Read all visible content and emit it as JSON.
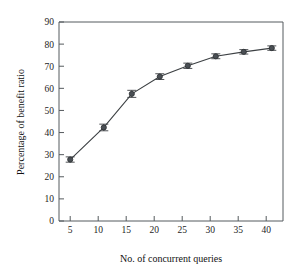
{
  "chart_data": {
    "type": "line",
    "title": "",
    "xlabel": "No. of concurrent queries",
    "ylabel": "Percentage of benefit ratio",
    "xlim": [
      3,
      43
    ],
    "ylim": [
      0,
      90
    ],
    "grid": false,
    "legend": null,
    "xticks": [
      5,
      10,
      15,
      20,
      25,
      30,
      35,
      40
    ],
    "yticks": [
      0,
      10,
      20,
      30,
      40,
      50,
      60,
      70,
      80,
      90
    ],
    "xticklabels": [
      "5",
      "10",
      "15",
      "20",
      "25",
      "30",
      "35",
      "40"
    ],
    "yticklabels": [
      "0",
      "10",
      "20",
      "30",
      "40",
      "50",
      "60",
      "70",
      "80",
      "90"
    ],
    "marker": "circle",
    "error_bars": "symmetric-horizontal-caps",
    "series": [
      {
        "name": "Percentage of benefit ratio",
        "color": "#4a4f54",
        "x": [
          5,
          11,
          16,
          21,
          26,
          31,
          36,
          41
        ],
        "values": [
          27.8,
          42.3,
          57.5,
          65.3,
          70.2,
          74.5,
          76.5,
          78.2
        ],
        "yerr": [
          1.2,
          1.5,
          1.6,
          1.3,
          1.2,
          1.1,
          1.0,
          1.0
        ]
      }
    ]
  }
}
